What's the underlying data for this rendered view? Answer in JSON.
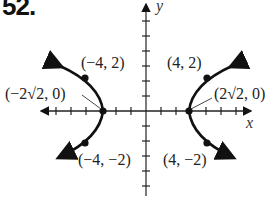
{
  "problem": {
    "number": "52."
  },
  "axes": {
    "x_label": "x",
    "y_label": "y"
  },
  "points": {
    "upper_left": "(−4, 2)",
    "upper_right": "(4, 2)",
    "lower_left": "(−4, −2)",
    "lower_right": "(4, −2)",
    "vertex_left": "(−2√2, 0)",
    "vertex_right": "(2√2, 0)"
  },
  "diagram": {
    "type": "hyperbola",
    "vertices": [
      [
        -2.83,
        0
      ],
      [
        2.83,
        0
      ]
    ],
    "labeled_points": [
      [
        -4,
        2
      ],
      [
        4,
        2
      ],
      [
        -4,
        -2
      ],
      [
        4,
        -2
      ]
    ],
    "curve_color": "#111111"
  }
}
